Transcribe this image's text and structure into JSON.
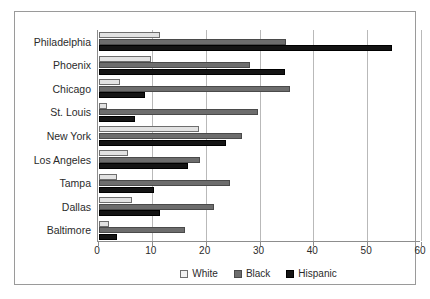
{
  "chart_data": {
    "type": "bar",
    "orientation": "horizontal",
    "title": "",
    "xlabel": "",
    "ylabel": "",
    "xlim": [
      0,
      60
    ],
    "xticks": [
      0,
      10,
      20,
      30,
      40,
      50,
      60
    ],
    "xtick_labels": [
      "0",
      "10",
      "20",
      "30",
      "40",
      "50",
      "60"
    ],
    "grid": "vertical",
    "legend_position": "bottom",
    "categories": [
      "Philadelphia",
      "Phoenix",
      "Chicago",
      "St. Louis",
      "New York",
      "Los Angeles",
      "Tampa",
      "Dallas",
      "Baltimore"
    ],
    "series": [
      {
        "name": "White",
        "color": "#e2e2e2",
        "values": [
          11.4,
          9.7,
          3.9,
          1.5,
          18.5,
          5.4,
          3.3,
          6.2,
          1.9
        ]
      },
      {
        "name": "Black",
        "color": "#6d6d6d",
        "values": [
          34.8,
          28.1,
          35.5,
          29.6,
          26.6,
          18.8,
          24.4,
          21.3,
          16.0
        ]
      },
      {
        "name": "Hispanic",
        "color": "#141414",
        "values": [
          54.5,
          34.6,
          8.6,
          6.7,
          23.5,
          16.6,
          10.2,
          11.4,
          3.3
        ]
      }
    ]
  },
  "legend": {
    "items": [
      {
        "label": "White",
        "swatch": "white-swatch-icon"
      },
      {
        "label": "Black",
        "swatch": "black-swatch-icon"
      },
      {
        "label": "Hispanic",
        "swatch": "hispanic-swatch-icon"
      }
    ]
  },
  "colors": {
    "white_series": "#e2e2e2",
    "black_series": "#6d6d6d",
    "hispanic_series": "#141414",
    "gridline": "#b9b9b9",
    "axis": "#8d8d8d",
    "frame": "#9a9a9a",
    "text": "#2b2b2b"
  }
}
